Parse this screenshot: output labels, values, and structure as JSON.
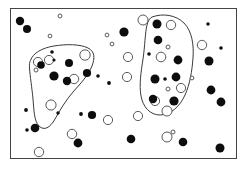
{
  "figure": {
    "canvas": {
      "width": 247,
      "height": 172,
      "background": "#ffffff"
    },
    "frame": {
      "x": 10.5,
      "y": 8.5,
      "width": 226,
      "height": 150,
      "stroke": "#444444",
      "stroke_width": 1,
      "fill": "none"
    },
    "style": {
      "filled_color": "#0d0d0d",
      "open_fill": "#ffffff",
      "open_stroke": "#5a5a5a",
      "open_stroke_width": 1,
      "contour_stroke": "#3a3a3a",
      "contour_stroke_width": 1
    }
  },
  "chart_data": {
    "type": "scatter",
    "xlabel": "",
    "ylabel": "",
    "xlim": [
      10,
      237
    ],
    "ylim": [
      8,
      159
    ],
    "grid": false,
    "legend": null,
    "axis_visible": false,
    "series": [
      {
        "name": "filled-points",
        "marker": "filled-circle",
        "color": "#0d0d0d",
        "count": 44,
        "points": [
          {
            "x": 20,
            "y": 21,
            "r": 4.2,
            "cluster": null
          },
          {
            "x": 27,
            "y": 29,
            "r": 4.0,
            "cluster": null
          },
          {
            "x": 41,
            "y": 65,
            "r": 3.8,
            "cluster": "left"
          },
          {
            "x": 54,
            "y": 60,
            "r": 1.6,
            "cluster": "left"
          },
          {
            "x": 52,
            "y": 52,
            "r": 1.8,
            "cluster": "left"
          },
          {
            "x": 69,
            "y": 63,
            "r": 4.0,
            "cluster": "left"
          },
          {
            "x": 54,
            "y": 76,
            "r": 4.6,
            "cluster": "left"
          },
          {
            "x": 67,
            "y": 81,
            "r": 4.2,
            "cluster": "left"
          },
          {
            "x": 58,
            "y": 113,
            "r": 1.7,
            "cluster": "left"
          },
          {
            "x": 87,
            "y": 73,
            "r": 4.1,
            "cluster": null
          },
          {
            "x": 98,
            "y": 76,
            "r": 1.8,
            "cluster": null
          },
          {
            "x": 26,
            "y": 110,
            "r": 1.9,
            "cluster": null
          },
          {
            "x": 27,
            "y": 130,
            "r": 1.8,
            "cluster": null
          },
          {
            "x": 35,
            "y": 128,
            "r": 4.3,
            "cluster": null
          },
          {
            "x": 81,
            "y": 114,
            "r": 1.9,
            "cluster": null
          },
          {
            "x": 92,
            "y": 115,
            "r": 4.1,
            "cluster": null
          },
          {
            "x": 78,
            "y": 143,
            "r": 4.4,
            "cluster": null
          },
          {
            "x": 124,
            "y": 32,
            "r": 4.6,
            "cluster": null
          },
          {
            "x": 131,
            "y": 139,
            "r": 4.3,
            "cluster": null
          },
          {
            "x": 157,
            "y": 24,
            "r": 4.5,
            "cluster": "right"
          },
          {
            "x": 158,
            "y": 40,
            "r": 4.3,
            "cluster": "right"
          },
          {
            "x": 149,
            "y": 54,
            "r": 1.8,
            "cluster": "right"
          },
          {
            "x": 178,
            "y": 60,
            "r": 4.4,
            "cluster": "right"
          },
          {
            "x": 155,
            "y": 79,
            "r": 4.5,
            "cluster": "right"
          },
          {
            "x": 165,
            "y": 79,
            "r": 1.8,
            "cluster": "right"
          },
          {
            "x": 176,
            "y": 77,
            "r": 4.4,
            "cluster": "right"
          },
          {
            "x": 153,
            "y": 99,
            "r": 4.2,
            "cluster": "right"
          },
          {
            "x": 174,
            "y": 101,
            "r": 4.6,
            "cluster": "right"
          },
          {
            "x": 209,
            "y": 61,
            "r": 4.5,
            "cluster": null
          },
          {
            "x": 208,
            "y": 24,
            "r": 1.7,
            "cluster": null
          },
          {
            "x": 221,
            "y": 48,
            "r": 1.8,
            "cluster": null
          },
          {
            "x": 211,
            "y": 90,
            "r": 4.4,
            "cluster": null
          },
          {
            "x": 221,
            "y": 102,
            "r": 4.4,
            "cluster": null
          },
          {
            "x": 220,
            "y": 148,
            "r": 4.5,
            "cluster": null
          },
          {
            "x": 183,
            "y": 142,
            "r": 4.3,
            "cluster": null
          },
          {
            "x": 109,
            "y": 83,
            "r": 1.9,
            "cluster": null
          }
        ]
      },
      {
        "name": "open-points",
        "marker": "open-circle",
        "color": "#5a5a5a",
        "count": 28,
        "points": [
          {
            "x": 60,
            "y": 16,
            "r": 2.0,
            "cluster": null
          },
          {
            "x": 50,
            "y": 36,
            "r": 1.9,
            "cluster": null
          },
          {
            "x": 107,
            "y": 35,
            "r": 1.9,
            "cluster": null
          },
          {
            "x": 112,
            "y": 44,
            "r": 1.9,
            "cluster": null
          },
          {
            "x": 38,
            "y": 62,
            "r": 4.6,
            "cluster": "left"
          },
          {
            "x": 49,
            "y": 60,
            "r": 4.6,
            "cluster": "left"
          },
          {
            "x": 36,
            "y": 70,
            "r": 2.0,
            "cluster": "left"
          },
          {
            "x": 85,
            "y": 55,
            "r": 5.2,
            "cluster": "left"
          },
          {
            "x": 74,
            "y": 79,
            "r": 4.7,
            "cluster": "left"
          },
          {
            "x": 51,
            "y": 105,
            "r": 5.1,
            "cluster": "left"
          },
          {
            "x": 128,
            "y": 57,
            "r": 4.6,
            "cluster": null
          },
          {
            "x": 127,
            "y": 77,
            "r": 4.6,
            "cluster": null
          },
          {
            "x": 143,
            "y": 20,
            "r": 5.0,
            "cluster": null
          },
          {
            "x": 171,
            "y": 25,
            "r": 4.7,
            "cluster": "right"
          },
          {
            "x": 168,
            "y": 47,
            "r": 2.0,
            "cluster": "right"
          },
          {
            "x": 161,
            "y": 57,
            "r": 4.8,
            "cluster": "right"
          },
          {
            "x": 192,
            "y": 78,
            "r": 1.9,
            "cluster": "right"
          },
          {
            "x": 168,
            "y": 89,
            "r": 2.0,
            "cluster": "right"
          },
          {
            "x": 181,
            "y": 88,
            "r": 4.6,
            "cluster": "right"
          },
          {
            "x": 155,
            "y": 101,
            "r": 4.6,
            "cluster": "right"
          },
          {
            "x": 167,
            "y": 111,
            "r": 5.0,
            "cluster": "right"
          },
          {
            "x": 202,
            "y": 45,
            "r": 4.7,
            "cluster": null
          },
          {
            "x": 138,
            "y": 116,
            "r": 4.6,
            "cluster": null
          },
          {
            "x": 72,
            "y": 134,
            "r": 4.7,
            "cluster": null
          },
          {
            "x": 39,
            "y": 152,
            "r": 4.7,
            "cluster": null
          },
          {
            "x": 108,
            "y": 120,
            "r": 4.6,
            "cluster": null
          },
          {
            "x": 173,
            "y": 132,
            "r": 2.0,
            "cluster": null
          },
          {
            "x": 167,
            "y": 137,
            "r": 5.0,
            "cluster": null
          }
        ]
      }
    ],
    "annotations": [
      {
        "name": "left-cluster-contour",
        "type": "closed-curve",
        "label": "",
        "path": "M 30.5 60.5 C 33 53, 42 48, 54 46 C 66 44, 80 44, 88 48 C 95 51.5, 95 58, 92 66 C 88 76, 80 84, 73 92 C 66 100, 60 110, 55 119 C 50 128, 44 131, 39 126 C 34 121, 34 110, 33 99 C 32 88, 30 76, 29.5 68 C 29.2 64.5, 29.6 62, 30.5 60.5 Z"
      },
      {
        "name": "right-cluster-contour",
        "type": "closed-curve",
        "label": "",
        "path": "M 152 17 C 163 13, 176 15, 184 23 C 192 31, 194 45, 193 58 C 192 71, 190 84, 185 95 C 180 106, 171 115, 160 115 C 150 115, 143 107, 141 96 C 139 85, 141 72, 143 59 C 145 46, 145 33, 147 25 C 148 20.5, 150 18, 152 17 Z"
      }
    ]
  }
}
